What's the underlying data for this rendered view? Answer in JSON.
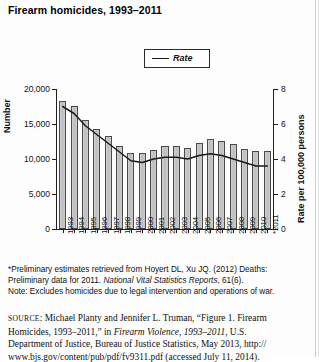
{
  "figure": {
    "title": "Firearm homicides, 1993–2011",
    "legend": {
      "label": "Rate",
      "swatch": "line-swatch"
    },
    "axis_left_title": "Number",
    "axis_right_title": "Rate per 100,000 persons"
  },
  "notes": {
    "line1": "*Preliminary estimates retrieved from Hoyert DL, Xu JQ. (2012) Deaths:",
    "line2_a": "Preliminary data for 2011. ",
    "line2_b": "National Vital Statistics Reports",
    "line2_c": ", 61(6).",
    "line3": "Note: Excludes homicides due to legal intervention and operations of war."
  },
  "source": {
    "label": "source",
    "colon": ": ",
    "text1": "Michael Planty and Jennifer L. Truman, “Figure 1. Firearm",
    "text2_a": "Homicides, 1993–2011,” in ",
    "text2_b": "Firearm Violence, 1993–2011",
    "text2_c": ", U.S.",
    "text3": "Department of Justice, Bureau of Justice Statistics, May 2013, http://",
    "text4": "www.bjs.gov/content/pub/pdf/fv9311.pdf (accessed July 11, 2014)."
  },
  "chart_data": {
    "type": "bar",
    "title": "Firearm homicides, 1993–2011",
    "xlabel": "",
    "ylabel": "Number",
    "y2label": "Rate per 100,000 persons",
    "ylim": [
      0,
      20000
    ],
    "y2lim": [
      0,
      8
    ],
    "yticks": [
      0,
      5000,
      10000,
      15000,
      20000
    ],
    "ytick_labels": [
      "0",
      "5,000",
      "10,000",
      "15,000",
      "20,000"
    ],
    "y2ticks": [
      0,
      2,
      4,
      6,
      8
    ],
    "y2tick_labels": [
      "0",
      "2",
      "4",
      "6",
      "8"
    ],
    "grid": false,
    "legend": [
      "Rate"
    ],
    "legend_position": "top-center",
    "categories": [
      "1993",
      "1994",
      "1995",
      "1996",
      "1997",
      "1998",
      "1999",
      "2000",
      "2001",
      "2002",
      "2003",
      "2004",
      "2005",
      "2006",
      "2007",
      "2008",
      "2009",
      "2010",
      "*2011"
    ],
    "series": [
      {
        "name": "Number",
        "kind": "bar",
        "axis": "left",
        "values": [
          18253,
          17527,
          15551,
          14327,
          13252,
          11798,
          10828,
          10801,
          11348,
          11829,
          11920,
          11624,
          12352,
          12791,
          12632,
          12179,
          11493,
          11078,
          11101
        ]
      },
      {
        "name": "Rate",
        "kind": "line",
        "axis": "right",
        "values": [
          7.0,
          6.6,
          5.9,
          5.4,
          4.9,
          4.4,
          3.9,
          3.8,
          4.0,
          4.1,
          4.1,
          4.0,
          4.2,
          4.3,
          4.2,
          4.0,
          3.8,
          3.6,
          3.6
        ]
      }
    ]
  }
}
